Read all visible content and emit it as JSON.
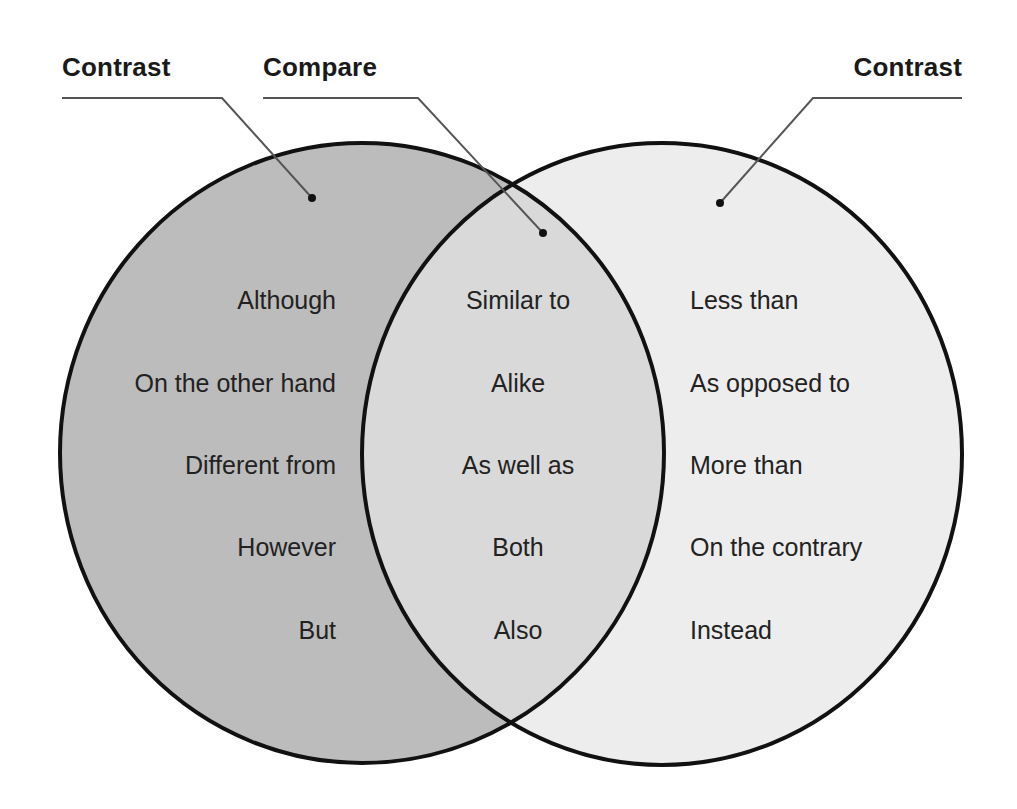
{
  "labels": {
    "left": "Contrast",
    "middle": "Compare",
    "right": "Contrast"
  },
  "columns": {
    "left": [
      "Although",
      "On the other hand",
      "Different from",
      "However",
      "But"
    ],
    "middle": [
      "Similar to",
      "Alike",
      "As well as",
      "Both",
      "Also"
    ],
    "right": [
      "Less than",
      "As opposed to",
      "More than",
      "On the contrary",
      "Instead"
    ]
  },
  "colors": {
    "left_fill": "#bcbcbc",
    "intersection_fill": "#d9d9d9",
    "right_fill": "#ededed",
    "outline": "#111111",
    "callout": "#555555"
  }
}
